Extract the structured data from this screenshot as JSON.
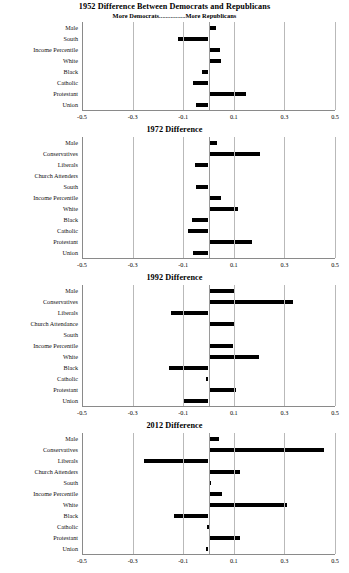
{
  "figure": {
    "axis_min": -0.5,
    "axis_max": 0.5,
    "tick_labels": [
      "-0.5",
      "-0.3",
      "-0.1",
      "0.1",
      "0.3",
      "0.5"
    ],
    "tick_values": [
      -0.5,
      -0.3,
      -0.1,
      0.1,
      0.3,
      0.5
    ],
    "bar_color": "#000000",
    "grid_color": "#b9b9b9"
  },
  "panels": [
    {
      "title": "1952 Difference Between Democrats and Republicans",
      "subtitle": "More Democrats................More Republicans",
      "year": "1952"
    },
    {
      "title": "1972 Difference",
      "subtitle": "",
      "year": "1972"
    },
    {
      "title": "1992 Difference",
      "subtitle": "",
      "year": "1992"
    },
    {
      "title": "2012 Difference",
      "subtitle": "",
      "year": "2012"
    }
  ],
  "chart_data": [
    {
      "type": "bar",
      "orientation": "horizontal",
      "title": "1952 Difference Between Democrats and Republicans",
      "subtitle": "More Democrats................More Republicans",
      "xlabel": "",
      "ylabel": "",
      "xlim": [
        -0.5,
        0.5
      ],
      "xticks": [
        -0.5,
        -0.3,
        -0.1,
        0.1,
        0.3,
        0.5
      ],
      "grid": true,
      "legend": "none",
      "categories": [
        "Male",
        "South",
        "Income Percentile",
        "White",
        "Black",
        "Catholic",
        "Protestant",
        "Union"
      ],
      "values": [
        0.03,
        -0.12,
        0.045,
        0.05,
        -0.025,
        -0.06,
        0.15,
        -0.05
      ]
    },
    {
      "type": "bar",
      "orientation": "horizontal",
      "title": "1972 Difference",
      "subtitle": "",
      "xlabel": "",
      "ylabel": "",
      "xlim": [
        -0.5,
        0.5
      ],
      "xticks": [
        -0.5,
        -0.3,
        -0.1,
        0.1,
        0.3,
        0.5
      ],
      "grid": true,
      "legend": "none",
      "categories": [
        "Male",
        "Conservatives",
        "Liberals",
        "Church Attenders",
        "South",
        "Income Percentile",
        "White",
        "Black",
        "Catholic",
        "Protestant",
        "Union"
      ],
      "values": [
        0.035,
        0.205,
        -0.055,
        0.0,
        -0.05,
        0.05,
        0.115,
        -0.065,
        -0.08,
        0.17,
        -0.06
      ]
    },
    {
      "type": "bar",
      "orientation": "horizontal",
      "title": "1992 Difference",
      "subtitle": "",
      "xlabel": "",
      "ylabel": "",
      "xlim": [
        -0.5,
        0.5
      ],
      "xticks": [
        -0.5,
        -0.3,
        -0.1,
        0.1,
        0.3,
        0.5
      ],
      "grid": true,
      "legend": "none",
      "categories": [
        "Male",
        "Conservatives",
        "Liberals",
        "Church Attendance",
        "South",
        "Income Percentile",
        "White",
        "Black",
        "Catholic",
        "Protestant",
        "Union"
      ],
      "values": [
        0.1,
        0.335,
        -0.15,
        0.1,
        0.005,
        0.095,
        0.2,
        -0.155,
        -0.01,
        0.11,
        -0.095
      ]
    },
    {
      "type": "bar",
      "orientation": "horizontal",
      "title": "2012 Difference",
      "subtitle": "",
      "xlabel": "",
      "ylabel": "",
      "xlim": [
        -0.5,
        0.5
      ],
      "xticks": [
        -0.5,
        -0.3,
        -0.1,
        0.1,
        0.3,
        0.5
      ],
      "grid": true,
      "legend": "none",
      "categories": [
        "Male",
        "Conservatives",
        "Liberals",
        "Church Attenders",
        "South",
        "Income Percentile",
        "White",
        "Black",
        "Catholic",
        "Protestant",
        "Union"
      ],
      "values": [
        0.04,
        0.455,
        -0.255,
        0.125,
        0.008,
        0.055,
        0.31,
        -0.135,
        -0.004,
        0.125,
        -0.01
      ]
    }
  ]
}
